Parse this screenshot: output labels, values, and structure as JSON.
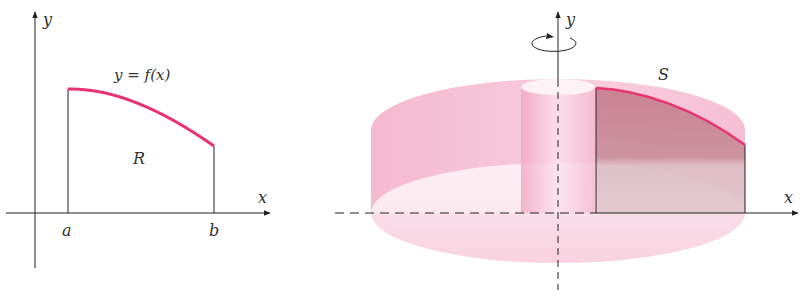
{
  "left_figure": {
    "y_axis_label": "y",
    "x_axis_label": "x",
    "curve_label": "y = f(x)",
    "region_label": "R",
    "tick_a": "a",
    "tick_b": "b"
  },
  "right_figure": {
    "y_axis_label": "y",
    "x_axis_label": "x",
    "solid_label": "S",
    "rotation_indicator": "rotation about y-axis"
  },
  "colors": {
    "curve": "#e8336e",
    "solid_fill": "#ee9ab8",
    "region_fill": "#b9707f",
    "axis": "#222222",
    "label": "#444444"
  }
}
